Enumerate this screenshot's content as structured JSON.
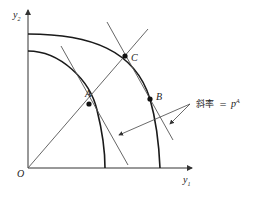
{
  "diagram": {
    "axes": {
      "x_label": "y",
      "x_sub": "1",
      "y_label": "y",
      "y_sub": "2",
      "origin_label": "O"
    },
    "points": {
      "A": "A",
      "B": "B",
      "C": "C"
    },
    "annotation": {
      "text": "斜率 = p",
      "prefix": "斜率",
      "equals": "=",
      "var": "p",
      "superscript": "A"
    },
    "colors": {
      "curve": "#1a1a1a",
      "line": "#555555",
      "background": "#ffffff"
    }
  }
}
